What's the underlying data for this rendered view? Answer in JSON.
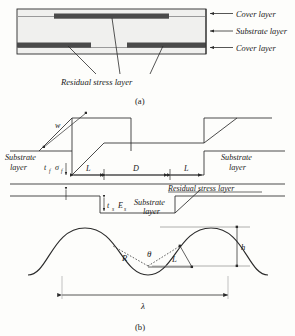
{
  "figure": {
    "panel_a": {
      "caption": "(a)",
      "labels": {
        "cover_top": "Cover layer",
        "substrate": "Substrate layer",
        "cover_bottom": "Cover layer",
        "residual": "Residual stress layer"
      },
      "colors": {
        "substrate_fill": "#f0f0ee",
        "stress_band": "#4a4a4a",
        "thin_band": "#9a9a9a",
        "outline": "#2b2b2b"
      }
    },
    "panel_b": {
      "caption": "(b)",
      "top_diagram": {
        "labels": {
          "width": "w",
          "substrate_left_line1": "Substrate",
          "substrate_left_line2": "layer",
          "substrate_right_line1": "Substrate",
          "substrate_right_line2": "layer",
          "substrate_lower_line1": "Substrate",
          "substrate_lower_line2": "layer",
          "film_thickness": "t",
          "film_thickness_sub": "f",
          "film_stress": "σ",
          "film_stress_sub": "f",
          "sub_thickness": "t",
          "sub_thickness_sub": "s",
          "sub_modulus": "E",
          "sub_modulus_sub": "s",
          "dim_left": "L",
          "dim_mid": "D",
          "dim_right": "L",
          "residual": "Residual stress layer"
        }
      },
      "wave_diagram": {
        "labels": {
          "radius": "R",
          "angle": "θ",
          "arc_length": "L",
          "height": "h",
          "wavelength": "λ"
        }
      }
    }
  }
}
